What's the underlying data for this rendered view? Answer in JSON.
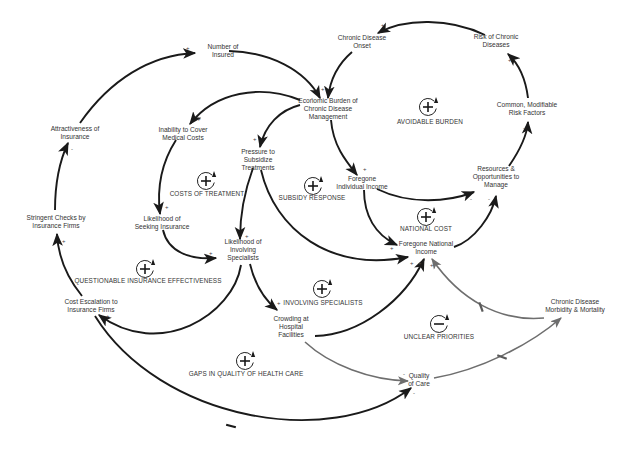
{
  "diagram": {
    "type": "causal-loop-diagram",
    "nodes": [
      {
        "id": "number_insured",
        "lines": [
          "Number of",
          "Insured"
        ]
      },
      {
        "id": "chronic_onset",
        "lines": [
          "Chronic Disease",
          "Onset"
        ]
      },
      {
        "id": "risk_chronic",
        "lines": [
          "Risk of Chronic",
          "Diseases"
        ]
      },
      {
        "id": "economic_burden",
        "lines": [
          "Economic Burden of",
          "Chronic Disease",
          "Management"
        ]
      },
      {
        "id": "attractiveness",
        "lines": [
          "Attractiveness of",
          "Insurance"
        ]
      },
      {
        "id": "inability_cover",
        "lines": [
          "Inability to Cover",
          "Medical Costs"
        ]
      },
      {
        "id": "pressure_subsidize",
        "lines": [
          "Pressure to",
          "Subsidize",
          "Treatments"
        ]
      },
      {
        "id": "common_risk",
        "lines": [
          "Common, Modifiable",
          "Risk Factors"
        ]
      },
      {
        "id": "foregone_individual",
        "lines": [
          "Foregone",
          "Individual Income"
        ]
      },
      {
        "id": "resources_manage",
        "lines": [
          "Resources &",
          "Opportunities to",
          "Manage"
        ]
      },
      {
        "id": "stringent_checks",
        "lines": [
          "Stringent Checks by",
          "Insurance Firms"
        ]
      },
      {
        "id": "likelihood_insurance",
        "lines": [
          "Likelihood of",
          "Seeking Insurance"
        ]
      },
      {
        "id": "likelihood_specialists",
        "lines": [
          "Likelihood of",
          "Involving",
          "Specialists"
        ]
      },
      {
        "id": "foregone_national",
        "lines": [
          "Foregone National",
          "Income"
        ]
      },
      {
        "id": "cost_escalation",
        "lines": [
          "Cost Escalation to",
          "Insurance Firms"
        ]
      },
      {
        "id": "crowding",
        "lines": [
          "Crowding at",
          "Hospital",
          "Facilities"
        ]
      },
      {
        "id": "morbidity",
        "lines": [
          "Chronic Disease",
          "Morbidity & Mortality"
        ]
      },
      {
        "id": "quality_care",
        "lines": [
          "Quality",
          "of Care"
        ]
      }
    ],
    "loops": [
      {
        "id": "avoidable_burden",
        "label": "AVOIDABLE BURDEN",
        "sign": "+"
      },
      {
        "id": "costs_treatment",
        "label": "COSTS OF TREATMENT",
        "sign": "+"
      },
      {
        "id": "subsidy_response",
        "label": "SUBSIDY RESPONSE",
        "sign": "+"
      },
      {
        "id": "national_cost",
        "label": "NATIONAL COST",
        "sign": "+"
      },
      {
        "id": "questionable_insurance",
        "label": "QUESTIONABLE INSURANCE EFFECTIVENESS",
        "sign": "+"
      },
      {
        "id": "involving_specialists",
        "label": "INVOLVING SPECIALISTS",
        "sign": "+"
      },
      {
        "id": "unclear_priorities",
        "label": "UNCLEAR PRIORITIES",
        "sign": "−"
      },
      {
        "id": "gaps_quality",
        "label": "GAPS IN QUALITY OF HEALTH CARE",
        "sign": "+"
      }
    ],
    "edges": [
      {
        "from": "number_insured",
        "to": "economic_burden",
        "polarity": "-",
        "delay": false
      },
      {
        "from": "attractiveness",
        "to": "number_insured",
        "polarity": "+",
        "delay": false
      },
      {
        "from": "chronic_onset",
        "to": "economic_burden",
        "polarity": "+",
        "delay": false
      },
      {
        "from": "risk_chronic",
        "to": "chronic_onset",
        "polarity": "+",
        "delay": false
      },
      {
        "from": "common_risk",
        "to": "risk_chronic",
        "polarity": "+",
        "delay": false
      },
      {
        "from": "resources_manage",
        "to": "common_risk",
        "polarity": "-",
        "delay": false
      },
      {
        "from": "economic_burden",
        "to": "inability_cover",
        "polarity": "+",
        "delay": false
      },
      {
        "from": "economic_burden",
        "to": "pressure_subsidize",
        "polarity": "+",
        "delay": false
      },
      {
        "from": "economic_burden",
        "to": "foregone_individual",
        "polarity": "+",
        "delay": false
      },
      {
        "from": "foregone_individual",
        "to": "resources_manage",
        "polarity": "-",
        "delay": false
      },
      {
        "from": "foregone_individual",
        "to": "foregone_national",
        "polarity": "+",
        "delay": false
      },
      {
        "from": "foregone_national",
        "to": "resources_manage",
        "polarity": "-",
        "delay": false
      },
      {
        "from": "inability_cover",
        "to": "likelihood_insurance",
        "polarity": "+",
        "delay": false
      },
      {
        "from": "likelihood_insurance",
        "to": "likelihood_specialists",
        "polarity": "+",
        "delay": false
      },
      {
        "from": "pressure_subsidize",
        "to": "likelihood_specialists",
        "polarity": "+",
        "delay": false
      },
      {
        "from": "pressure_subsidize",
        "to": "foregone_national",
        "polarity": "+",
        "delay": false
      },
      {
        "from": "likelihood_specialists",
        "to": "cost_escalation",
        "polarity": "+",
        "delay": false
      },
      {
        "from": "likelihood_specialists",
        "to": "crowding",
        "polarity": "+",
        "delay": false
      },
      {
        "from": "cost_escalation",
        "to": "stringent_checks",
        "polarity": "+",
        "delay": false
      },
      {
        "from": "stringent_checks",
        "to": "attractiveness",
        "polarity": "-",
        "delay": false
      },
      {
        "from": "crowding",
        "to": "foregone_national",
        "polarity": "+",
        "delay": false
      },
      {
        "from": "crowding",
        "to": "quality_care",
        "polarity": "-",
        "delay": false
      },
      {
        "from": "morbidity",
        "to": "foregone_national",
        "polarity": "+",
        "delay": true
      },
      {
        "from": "quality_care",
        "to": "morbidity",
        "polarity": "-",
        "delay": true
      },
      {
        "from": "cost_escalation",
        "to": "quality_care",
        "polarity": "-",
        "delay": true
      }
    ]
  }
}
